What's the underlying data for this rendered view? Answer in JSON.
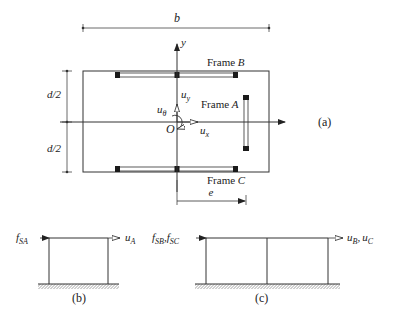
{
  "figure": {
    "panel_a_label": "(a)",
    "panel_b_label": "(b)",
    "panel_c_label": "(c)",
    "dims": {
      "width_label": "b",
      "half_depth_top": "d/2",
      "half_depth_bottom": "d/2",
      "eccentricity": "e"
    },
    "axes": {
      "x_label": "x",
      "y_label": "y",
      "origin_label": "O"
    },
    "dofs": {
      "ux_base": "u",
      "ux_sub": "x",
      "uy_base": "u",
      "uy_sub": "y",
      "utheta_base": "u",
      "utheta_sub": "θ"
    },
    "frames": {
      "frame_a_prefix": "Frame ",
      "frame_a": "A",
      "frame_b_prefix": "Frame ",
      "frame_b": "B",
      "frame_c_prefix": "Frame ",
      "frame_c": "C"
    },
    "panel_b": {
      "force_base": "f",
      "force_sub": "SA",
      "disp_base": "u",
      "disp_sub": "A"
    },
    "panel_c": {
      "force1_base": "f",
      "force1_sub": "SB",
      "force2_base": "f",
      "force2_sub": "SC",
      "sep": ",",
      "disp1_base": "u",
      "disp1_sub": "B",
      "disp2_base": "u",
      "disp2_sub": "C"
    },
    "colors": {
      "line": "#333333",
      "column_block": "#1a1a1a",
      "background": "#ffffff"
    }
  }
}
